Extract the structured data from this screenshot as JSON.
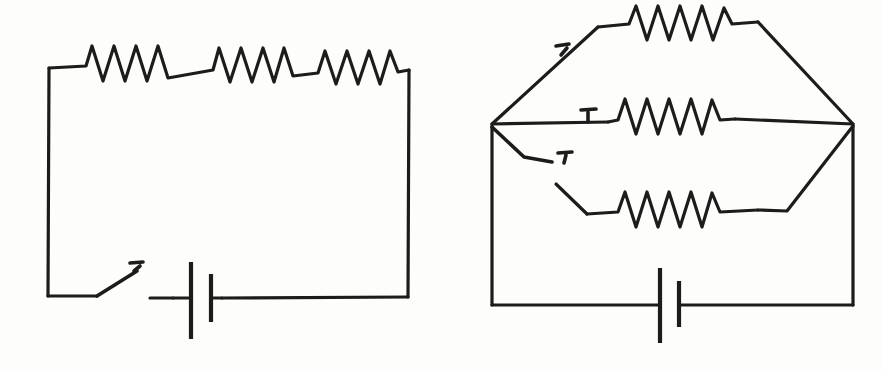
{
  "document": {
    "kind": "hand-drawn-schematic",
    "title": "Two electric circuit diagrams",
    "background_color": "#fdfdfb",
    "ink_color": "#1c1c1c",
    "width": 882,
    "height": 372,
    "caption": ""
  },
  "figures": [
    {
      "id": "left-circuit",
      "name": "series-circuit",
      "label": "",
      "description": "Single loop: three resistors in series along the top rail, an open knife switch and a battery cell along the bottom rail.",
      "components": [
        {
          "type": "resistor",
          "name": "resistor-series-1",
          "peaks": 4,
          "position": "top-left",
          "label": ""
        },
        {
          "type": "resistor",
          "name": "resistor-series-2",
          "peaks": 4,
          "position": "top-center",
          "label": ""
        },
        {
          "type": "resistor",
          "name": "resistor-series-3",
          "peaks": 4,
          "position": "top-right",
          "label": ""
        },
        {
          "type": "switch",
          "name": "switch-main",
          "state": "open",
          "position": "bottom-left",
          "label": ""
        },
        {
          "type": "battery",
          "name": "battery-cell",
          "cells": 1,
          "position": "bottom-center",
          "label": ""
        }
      ]
    },
    {
      "id": "right-circuit",
      "name": "parallel-circuit",
      "label": "",
      "description": "Three parallel resistor branches between a left node and a right node, each branch gated by a switch; battery on the bottom rail.",
      "components": [
        {
          "type": "resistor",
          "name": "resistor-parallel-top",
          "peaks": 5,
          "position": "top-branch",
          "label": ""
        },
        {
          "type": "resistor",
          "name": "resistor-parallel-middle",
          "peaks": 5,
          "position": "middle-branch",
          "label": ""
        },
        {
          "type": "resistor",
          "name": "resistor-parallel-bottom",
          "peaks": 5,
          "position": "bottom-branch",
          "label": ""
        },
        {
          "type": "switch",
          "name": "switch-top-branch",
          "state": "closed",
          "position": "top-branch",
          "label": ""
        },
        {
          "type": "switch",
          "name": "switch-middle-branch",
          "state": "closed",
          "position": "middle-branch",
          "label": ""
        },
        {
          "type": "switch",
          "name": "switch-bottom-branch",
          "state": "open",
          "position": "bottom-branch",
          "label": ""
        },
        {
          "type": "battery",
          "name": "battery-cell",
          "cells": 1,
          "position": "bottom-center",
          "label": ""
        }
      ]
    }
  ]
}
